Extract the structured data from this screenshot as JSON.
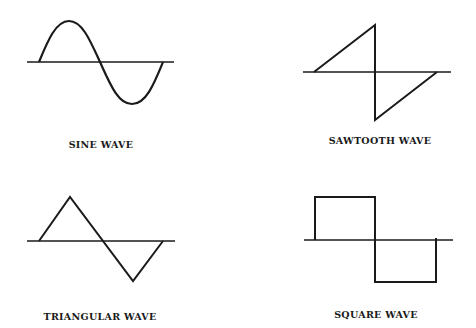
{
  "diagrams": [
    {
      "id": "sine",
      "label": "SINE WAVE",
      "type": "sine"
    },
    {
      "id": "sawtooth",
      "label": "SAWTOOTH WAVE",
      "type": "sawtooth"
    },
    {
      "id": "triangular",
      "label": "TRIANGULAR WAVE",
      "type": "triangular"
    },
    {
      "id": "square",
      "label": "SQUARE WAVE",
      "type": "square"
    }
  ],
  "colors": {
    "stroke": "#1a1a1a",
    "background": "#ffffff"
  }
}
